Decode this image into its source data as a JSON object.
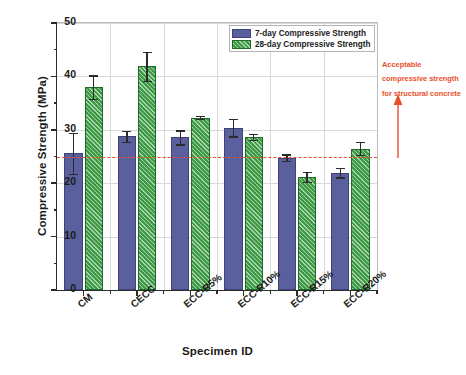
{
  "chart_data": {
    "type": "bar",
    "title": "",
    "xlabel": "Specimen ID",
    "ylabel": "Compressive Strength (MPa)",
    "categories": [
      "CM",
      "CECC",
      "ECC-R5%",
      "ECC-R10%",
      "ECC-R15%",
      "ECC-R20%"
    ],
    "series": [
      {
        "name": "7-day Compressive Strength",
        "color": "#5a5f9e",
        "values": [
          25.6,
          28.8,
          28.6,
          30.4,
          24.8,
          22.0
        ],
        "errors": [
          3.8,
          1.0,
          1.3,
          1.6,
          0.6,
          0.9
        ]
      },
      {
        "name": "28-day Compressive Strength",
        "color": "#3d9b45",
        "hatch": "diagonal",
        "values": [
          38.0,
          41.9,
          32.3,
          28.7,
          21.2,
          26.5
        ],
        "errors": [
          2.2,
          2.7,
          0.3,
          0.6,
          0.9,
          1.2
        ]
      }
    ],
    "ylim": [
      0,
      50
    ],
    "yticks": [
      0,
      10,
      20,
      30,
      40,
      50
    ],
    "ytick_labels": [
      "0",
      "10",
      "20",
      "30",
      "40",
      "50"
    ],
    "y_minor_ticks": [
      5,
      15,
      25,
      35,
      45
    ],
    "grid": true,
    "legend_position": "top-right",
    "reference_line": {
      "value": 25,
      "color": "#e8502a",
      "style": "dashed"
    },
    "annotation": {
      "lines": [
        "Acceptable",
        "compressive strength",
        "for structural concrete"
      ],
      "color": "#e8502a",
      "arrow": "up-arrow-to-reference-line"
    }
  },
  "legend": {
    "items": [
      {
        "label": "7-day Compressive Strength"
      },
      {
        "label": "28-day Compressive Strength"
      }
    ]
  }
}
